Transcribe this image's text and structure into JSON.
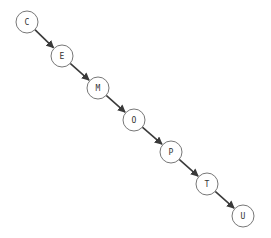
{
  "diagram": {
    "type": "linked-list / degenerate tree",
    "colors": {
      "background": "#ffffff",
      "node_fill": "#ffffff",
      "node_stroke": "#777777",
      "edge": "#3a3a3a",
      "label": "#333333"
    },
    "node_radius": 11,
    "nodes": [
      {
        "id": "C",
        "label": "C",
        "x": 27,
        "y": 22
      },
      {
        "id": "E",
        "label": "E",
        "x": 62,
        "y": 56
      },
      {
        "id": "M",
        "label": "M",
        "x": 98,
        "y": 88
      },
      {
        "id": "O",
        "label": "O",
        "x": 134,
        "y": 120
      },
      {
        "id": "P",
        "label": "P",
        "x": 171,
        "y": 152
      },
      {
        "id": "T",
        "label": "T",
        "x": 207,
        "y": 184
      },
      {
        "id": "U",
        "label": "U",
        "x": 243,
        "y": 216
      }
    ],
    "edges": [
      {
        "from": "C",
        "to": "E"
      },
      {
        "from": "E",
        "to": "M"
      },
      {
        "from": "M",
        "to": "O"
      },
      {
        "from": "O",
        "to": "P"
      },
      {
        "from": "P",
        "to": "T"
      },
      {
        "from": "T",
        "to": "U"
      }
    ]
  }
}
